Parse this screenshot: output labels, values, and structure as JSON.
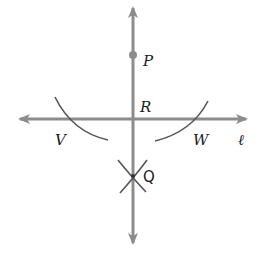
{
  "diagram": {
    "type": "geometric-construction",
    "colors": {
      "line": "#8c8c8c",
      "arc": "#555555",
      "text": "#1a1a1a",
      "point": "#8c8c8c"
    },
    "labels": {
      "P": "P",
      "R": "R",
      "V": "V",
      "W": "W",
      "Q": "Q",
      "line": "ℓ"
    },
    "points": {
      "P": {
        "x": 133,
        "y": 55
      },
      "R": {
        "x": 133,
        "y": 119
      },
      "V": {
        "x": 82,
        "y": 119
      },
      "W": {
        "x": 184,
        "y": 119
      },
      "Q": {
        "x": 133,
        "y": 176
      }
    }
  }
}
